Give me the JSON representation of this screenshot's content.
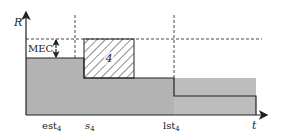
{
  "diagram": {
    "axes": {
      "y_label": "R",
      "x_label": "t"
    },
    "x_ticks": [
      {
        "id": "est",
        "base": "est",
        "sub": "4"
      },
      {
        "id": "s",
        "base": "s",
        "sub": "4"
      },
      {
        "id": "lst",
        "base": "lst",
        "sub": "4"
      }
    ],
    "mec_label": "MEC",
    "task_label": "4",
    "colors": {
      "fill_gray": "#b3b3b3",
      "outline": "#222222",
      "hatch": "#222222",
      "dashed": "#333333"
    }
  }
}
